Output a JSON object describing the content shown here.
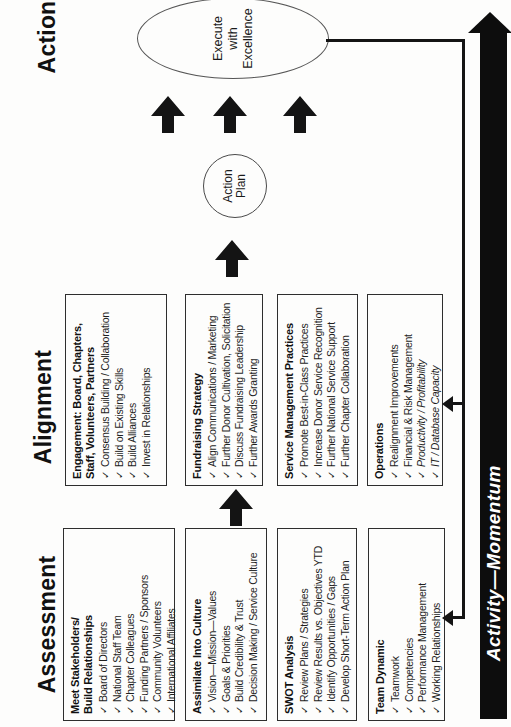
{
  "headings": {
    "assessment": "Assessment",
    "alignment": "Alignment",
    "action": "Action"
  },
  "icons": {
    "check": "✓"
  },
  "assessment": {
    "boxes": [
      {
        "title_lines": [
          "Meet Stakeholders/",
          "Build Relationships"
        ],
        "items": [
          "Board of Directors",
          "National Staff Team",
          "Chapter Colleagues",
          "Funding Partners / Sponsors",
          "Community Volunteers",
          "International Affiliates"
        ]
      },
      {
        "title_lines": [
          "Assimilate Into Culture"
        ],
        "items": [
          "Vision—Mission—Values",
          "Goals & Priorities",
          "Build Credibility & Trust",
          "Decision Making / Service Culture"
        ]
      },
      {
        "title_lines": [
          "SWOT Analysis"
        ],
        "items": [
          "Review Plans / Strategies",
          "Review Results vs. Objectives YTD",
          "Identify Opportunities / Gaps",
          "Develop Short-Term Action Plan"
        ]
      },
      {
        "title_lines": [
          "Team Dynamic"
        ],
        "items": [
          "Teamwork",
          "Competencies",
          "Performance Management",
          "Working Relationships"
        ]
      }
    ]
  },
  "alignment": {
    "boxes": [
      {
        "title_lines": [
          "Engagement: Board, Chapters,",
          "Staff, Volunteers, Partners"
        ],
        "items": [
          "Consensus Building / Collaboration",
          "Build on Existing Skills",
          "Build Alliances",
          "Invest in Relationships"
        ]
      },
      {
        "title_lines": [
          "Fundraising Strategy"
        ],
        "items": [
          "Align Communications / Marketing",
          "Further Donor Cultivation, Solicitation",
          "Discuss Fundraising Leadership",
          "Further Awards Granting"
        ]
      },
      {
        "title_lines": [
          "Service Management Practices"
        ],
        "items": [
          "Promote Best-in-Class Practices",
          "Increase Donor Service Recognition",
          "Further National Service Support",
          "Further Chapter Collaboration"
        ]
      },
      {
        "title_lines": [
          "Operations"
        ],
        "items": [
          "Realignment Improvements",
          "Financial & Risk Management",
          "Productivity / Profitability",
          "IT / Database Capacity"
        ]
      }
    ]
  },
  "action": {
    "plan_circle": {
      "line1": "Action",
      "line2": "Plan"
    },
    "ellipse": {
      "line1": "Execute",
      "line2": "with",
      "line3": "Excellence"
    }
  },
  "momentum": {
    "label": "Activity—Momentum"
  },
  "colors": {
    "ink": "#1a1a1a",
    "arrow": "#0d0d0d",
    "background": "#fdfdfc"
  }
}
